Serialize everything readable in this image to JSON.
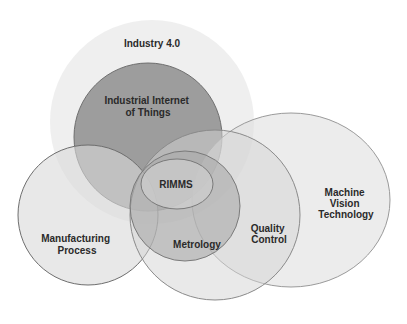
{
  "diagram": {
    "type": "venn",
    "colors": {
      "background": "#ffffff",
      "industry40_fill": "#ececec",
      "iiot_fill": "#8c8c8c",
      "light_fill": "#d6d6d6",
      "stroke": "#7a7a7a",
      "text": "#2a2a2a"
    },
    "sets": [
      {
        "id": "industry40",
        "label_lines": [
          "Industry 4.0"
        ]
      },
      {
        "id": "iiot",
        "label_lines": [
          "Industrial Internet",
          "of Things"
        ]
      },
      {
        "id": "manufacturing",
        "label_lines": [
          "Manufacturing",
          "Process"
        ]
      },
      {
        "id": "machine_vision",
        "label_lines": [
          "Machine",
          "Vision",
          "Technology"
        ]
      },
      {
        "id": "quality_control",
        "label_lines": [
          "Quality",
          "Control"
        ]
      },
      {
        "id": "metrology",
        "label_lines": [
          "Metrology"
        ]
      },
      {
        "id": "rimms",
        "label_lines": [
          "RIMMS"
        ]
      }
    ]
  }
}
